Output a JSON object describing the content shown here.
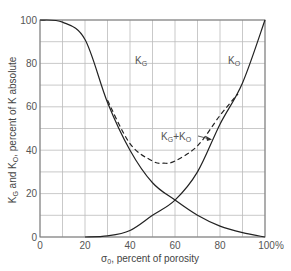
{
  "chart_data": {
    "type": "line",
    "title": "",
    "xlabel": "σ0, percent of porosity",
    "ylabel": "KG and KO, percent of K absolute",
    "xlim": [
      0,
      100
    ],
    "ylim": [
      0,
      100
    ],
    "grid": true,
    "x_ticks": [
      "0",
      "20",
      "40",
      "60",
      "80",
      "100%"
    ],
    "y_ticks": [
      "0",
      "20",
      "40",
      "60",
      "80",
      "100"
    ],
    "x": [
      0,
      10,
      20,
      30,
      40,
      50,
      60,
      70,
      80,
      90,
      100
    ],
    "series": [
      {
        "name": "KG",
        "label": "KG",
        "style": "solid",
        "values": [
          100,
          99,
          91,
          62,
          40,
          25,
          17,
          10,
          5,
          2,
          0
        ]
      },
      {
        "name": "KO",
        "label": "KO",
        "style": "solid",
        "values": [
          0,
          0,
          0,
          0.5,
          3,
          10,
          17,
          30,
          52,
          71,
          100
        ]
      },
      {
        "name": "KG+KO",
        "label": "KG+KO",
        "style": "dashed",
        "x": [
          30,
          40,
          50,
          55,
          60,
          70,
          80,
          88
        ],
        "values": [
          63,
          43,
          35,
          34,
          35,
          42,
          56,
          66
        ]
      }
    ],
    "annotations": [
      {
        "text": "KG",
        "x": 44,
        "y": 82
      },
      {
        "text": "KO",
        "x": 89,
        "y": 82
      },
      {
        "text": "KG+KO",
        "x": 62,
        "y": 47,
        "arrow_to": [
          76,
          50
        ]
      }
    ]
  },
  "labels": {
    "kg_main": "K",
    "kg_sub": "G",
    "ko_main": "K",
    "ko_sub": "O",
    "sum_a": "K",
    "sum_a_sub": "G",
    "sum_plus": "+K",
    "sum_b_sub": "O",
    "xlabel_sigma": "σ",
    "xlabel_sub": "0",
    "xlabel_rest": ", percent of porosity",
    "ylabel_k1": "K",
    "ylabel_k1_sub": "G",
    "ylabel_mid": " and K",
    "ylabel_k2_sub": "O",
    "ylabel_rest": ", percent of K absolute"
  },
  "colors": {
    "line": "#222222",
    "grid": "#bbbbbb",
    "text": "#555555"
  }
}
